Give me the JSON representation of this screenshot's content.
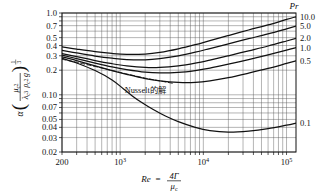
{
  "chart_data": {
    "type": "line",
    "title": "",
    "xlabel": "Re = 4Γ/μ_c",
    "ylabel": "α(μ_c²/(λ_c³ρ_c²g))^(1/3)",
    "xscale": "log",
    "yscale": "log",
    "xlim": [
      200,
      130000
    ],
    "ylim": [
      0.02,
      1.0
    ],
    "grid": true,
    "legend_position": "right",
    "legend_title": "Pr",
    "x_ticklabels": [
      "200",
      "10³",
      "10⁴",
      "10⁵"
    ],
    "x_tickvalues": [
      200,
      1000,
      10000,
      100000
    ],
    "y_ticklabels": [
      "1.0",
      "0.7",
      "0.5",
      "0.4",
      "0.3",
      "0.2",
      "0.10",
      "0.07",
      "0.05",
      "0.04",
      "0.03",
      "0.02"
    ],
    "y_tickvalues": [
      1.0,
      0.7,
      0.5,
      0.4,
      0.3,
      0.2,
      0.1,
      0.07,
      0.05,
      0.04,
      0.03,
      0.02
    ],
    "annotations": [
      {
        "text": "Nusselt的解",
        "x": 2000,
        "y": 0.105
      }
    ],
    "series": [
      {
        "name": "10.0",
        "label": "10.0",
        "style": "solid",
        "x": [
          200,
          300,
          500,
          800,
          1200,
          2000,
          3000,
          5000,
          8000,
          12000,
          20000,
          35000,
          60000,
          100000,
          130000
        ],
        "y": [
          0.385,
          0.362,
          0.337,
          0.32,
          0.312,
          0.315,
          0.33,
          0.365,
          0.41,
          0.46,
          0.53,
          0.62,
          0.715,
          0.835,
          0.9
        ]
      },
      {
        "name": "5.0",
        "label": "5.0",
        "style": "solid",
        "x": [
          200,
          300,
          500,
          800,
          1200,
          2000,
          3000,
          5000,
          8000,
          12000,
          20000,
          35000,
          60000,
          100000,
          130000
        ],
        "y": [
          0.35,
          0.325,
          0.298,
          0.28,
          0.27,
          0.268,
          0.277,
          0.3,
          0.332,
          0.368,
          0.42,
          0.485,
          0.555,
          0.64,
          0.69
        ]
      },
      {
        "name": "2.0",
        "label": "2.0",
        "style": "solid",
        "x": [
          200,
          300,
          500,
          800,
          1200,
          2000,
          3000,
          5000,
          8000,
          12000,
          20000,
          35000,
          60000,
          100000,
          130000
        ],
        "y": [
          0.32,
          0.293,
          0.262,
          0.24,
          0.226,
          0.216,
          0.216,
          0.226,
          0.244,
          0.266,
          0.3,
          0.345,
          0.395,
          0.455,
          0.49
        ]
      },
      {
        "name": "1.0",
        "label": "1.0",
        "style": "solid",
        "x": [
          200,
          300,
          500,
          800,
          1200,
          2000,
          3000,
          5000,
          8000,
          12000,
          20000,
          35000,
          60000,
          100000,
          130000
        ],
        "y": [
          0.305,
          0.277,
          0.244,
          0.219,
          0.203,
          0.189,
          0.185,
          0.188,
          0.198,
          0.212,
          0.237,
          0.27,
          0.308,
          0.352,
          0.378
        ]
      },
      {
        "name": "0.5",
        "label": "0.5",
        "style": "solid",
        "x": [
          200,
          300,
          500,
          800,
          1200,
          2000,
          3000,
          5000,
          8000,
          12000,
          20000,
          35000,
          60000,
          100000,
          130000
        ],
        "y": [
          0.292,
          0.262,
          0.226,
          0.198,
          0.178,
          0.158,
          0.148,
          0.142,
          0.142,
          0.148,
          0.162,
          0.184,
          0.21,
          0.242,
          0.26
        ]
      },
      {
        "name": "0.1",
        "label": "0.1",
        "style": "solid",
        "x": [
          200,
          300,
          500,
          800,
          1100,
          1400,
          1800,
          2500,
          3500,
          5000,
          8000,
          12000,
          20000,
          35000,
          60000,
          100000,
          130000
        ],
        "y": [
          0.28,
          0.245,
          0.198,
          0.152,
          0.118,
          0.097,
          0.081,
          0.066,
          0.055,
          0.047,
          0.04,
          0.0365,
          0.035,
          0.036,
          0.0385,
          0.0425,
          0.045
        ]
      },
      {
        "name": "Nusselt",
        "label": "Nusselt的解",
        "style": "dashed",
        "x": [
          200,
          300,
          500,
          800,
          1200,
          2000,
          3000,
          4500
        ],
        "y": [
          0.272,
          0.25,
          0.222,
          0.198,
          0.18,
          0.16,
          0.148,
          0.137
        ]
      }
    ]
  },
  "axes": {
    "pr_title": "Pr",
    "x_axis_label_parts": {
      "re": "Re",
      "eq": "=",
      "num": "4Γ",
      "den": "μ",
      "den_sub": "c"
    },
    "y_axis_label_parts": {
      "alpha": "α",
      "num": "μ",
      "num_sub": "c",
      "num_sup": "2",
      "den1": "λ",
      "den1_sub": "c",
      "den1_sup": "3",
      "den2": "ρ",
      "den2_sub": "c",
      "den2_sup": "2",
      "den3": "g",
      "exp_num": "1",
      "exp_den": "3"
    }
  }
}
